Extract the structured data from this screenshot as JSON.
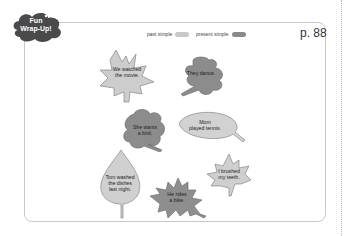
{
  "badge": {
    "line1": "Fun",
    "line2": "Wrap-Up!"
  },
  "legend": {
    "past_label": "past simple",
    "past_color": "#c9c9c9",
    "present_label": "present simple",
    "present_color": "#8a8a8a"
  },
  "page_number": "p. 88",
  "leaves": [
    {
      "text1": "We watched",
      "text2": "the movie.",
      "tense": "past"
    },
    {
      "text1": "They dance.",
      "text2": "",
      "tense": "present"
    },
    {
      "text1": "She wants",
      "text2": "a bird.",
      "tense": "present"
    },
    {
      "text1": "Mom",
      "text2": "played tennis.",
      "tense": "past"
    },
    {
      "text1": "Tom washed",
      "text2": "the dishes",
      "text3": "last night.",
      "tense": "past"
    },
    {
      "text1": "He rides",
      "text2": "a bike.",
      "tense": "present"
    },
    {
      "text1": "I brushed",
      "text2": "my teeth.",
      "tense": "past"
    }
  ]
}
